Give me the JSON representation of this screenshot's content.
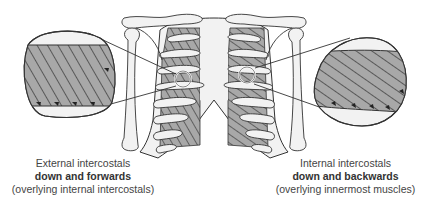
{
  "diagram": {
    "colors": {
      "muscle_fill": "#a8a8a8",
      "bone_fill": "#f2f2f2",
      "outline": "#333333",
      "background": "#ffffff",
      "text": "#444444"
    }
  },
  "captions": {
    "left": {
      "line1": "External intercostals",
      "line2": "down and forwards",
      "line3": "(overlying internal intercostals)"
    },
    "right": {
      "line1": "Internal intercostals",
      "line2": "down and backwards",
      "line3": "(overlying innermost muscles)"
    }
  },
  "magnifiers": {
    "left": {
      "label": "External intercostals magnified",
      "fiber_direction": "down and forwards"
    },
    "right": {
      "label": "Internal intercostals magnified",
      "fiber_direction": "down and backwards"
    }
  }
}
